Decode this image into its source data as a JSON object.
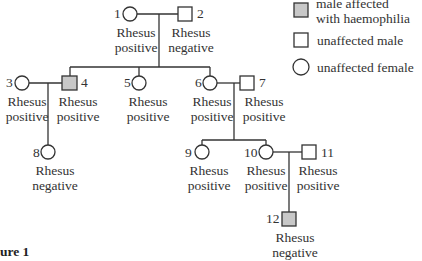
{
  "figure_label": "ure 1",
  "legend": [
    {
      "symbol": "shaded-square",
      "label_line1": "male affected",
      "label_line2": "with haemophilia"
    },
    {
      "symbol": "square",
      "label": "unaffected male"
    },
    {
      "symbol": "circle",
      "label": "unaffected female"
    }
  ],
  "colors": {
    "affected_fill": "#c8c8c8",
    "line": "#333333"
  },
  "individuals": [
    {
      "id": "1",
      "sex": "female",
      "affected": false,
      "rh_line1": "Rhesus",
      "rh_line2": "positive"
    },
    {
      "id": "2",
      "sex": "male",
      "affected": false,
      "rh_line1": "Rhesus",
      "rh_line2": "negative"
    },
    {
      "id": "3",
      "sex": "female",
      "affected": false,
      "rh_line1": "Rhesus",
      "rh_line2": "positive"
    },
    {
      "id": "4",
      "sex": "male",
      "affected": true,
      "rh_line1": "Rhesus",
      "rh_line2": "positive"
    },
    {
      "id": "5",
      "sex": "female",
      "affected": false,
      "rh_line1": "Rhesus",
      "rh_line2": "positive"
    },
    {
      "id": "6",
      "sex": "female",
      "affected": false,
      "rh_line1": "Rhesus",
      "rh_line2": "positive"
    },
    {
      "id": "7",
      "sex": "male",
      "affected": false,
      "rh_line1": "Rhesus",
      "rh_line2": "positive"
    },
    {
      "id": "8",
      "sex": "female",
      "affected": false,
      "rh_line1": "Rhesus",
      "rh_line2": "negative"
    },
    {
      "id": "9",
      "sex": "female",
      "affected": false,
      "rh_line1": "Rhesus",
      "rh_line2": "positive"
    },
    {
      "id": "10",
      "sex": "female",
      "affected": false,
      "rh_line1": "Rhesus",
      "rh_line2": "positive"
    },
    {
      "id": "11",
      "sex": "male",
      "affected": false,
      "rh_line1": "Rhesus",
      "rh_line2": "positive"
    },
    {
      "id": "12",
      "sex": "male",
      "affected": true,
      "rh_line1": "Rhesus",
      "rh_line2": "negative"
    }
  ]
}
